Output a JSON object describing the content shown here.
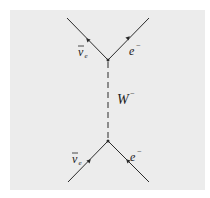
{
  "diagram": {
    "type": "feynman",
    "colors": {
      "panel": "#ececec",
      "line": "#2a2a2a",
      "background": "#ffffff"
    },
    "top_vertex": {
      "left_particle": {
        "symbol": "ν",
        "bar": true,
        "subscript": "e",
        "label": "ν̄e"
      },
      "right_particle": {
        "symbol": "e",
        "superscript": "−",
        "label": "e−"
      }
    },
    "propagator": {
      "symbol": "W",
      "superscript": "−",
      "label": "W−",
      "style": "dashed"
    },
    "bottom_vertex": {
      "left_particle": {
        "symbol": "ν",
        "bar": true,
        "subscript": "e",
        "label": "ν̄e"
      },
      "right_particle": {
        "symbol": "e",
        "superscript": "−",
        "label": "e−"
      }
    }
  }
}
